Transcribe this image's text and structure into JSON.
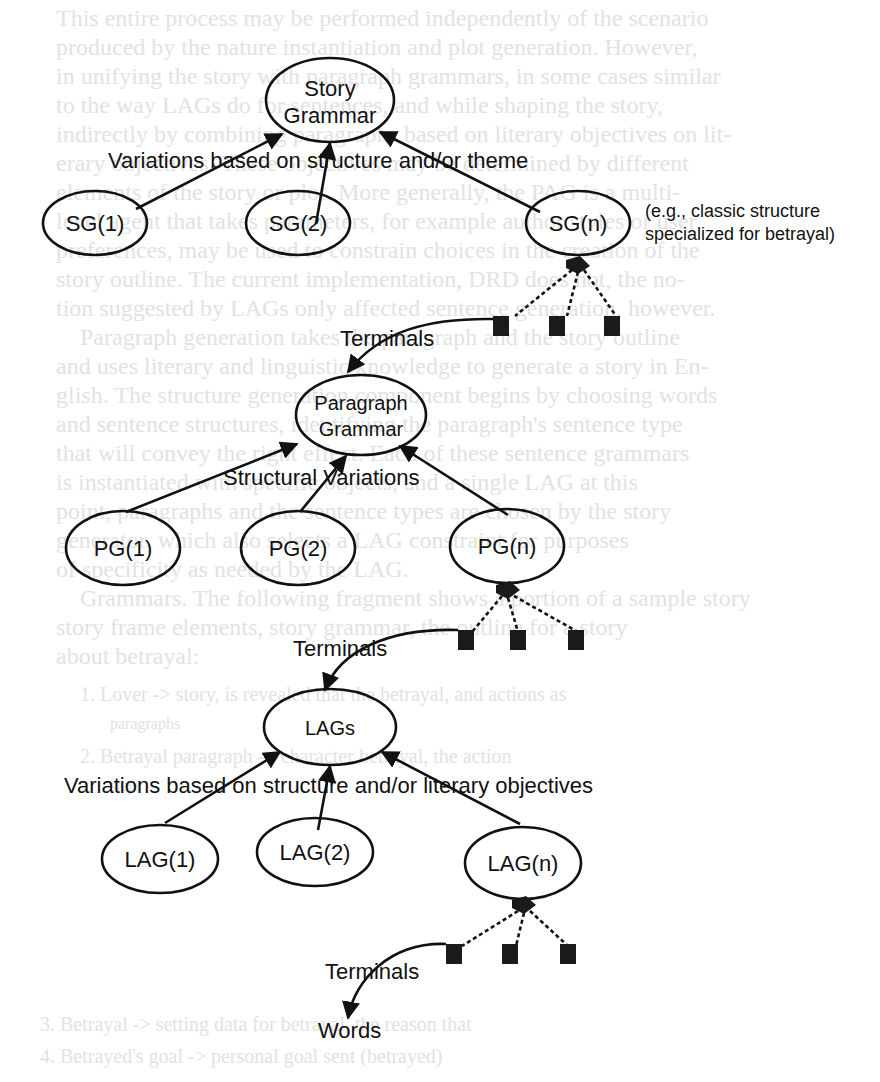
{
  "background_text": {
    "lines": [
      "This entire process may be performed independently of the scenario",
      "produced by the nature instantiation and plot generation. However,",
      "in unifying the story with paragraph grammars, in some cases similar",
      "to the way LAGs do for sentences, and while shaping the story,",
      "indirectly by combining paragraphs based on literary objectives on lit-",
      "erary objectives. These objectives may be determined by different",
      "elements of the story or plot. More generally, the PAG is a multi-",
      "level agent that takes parameters, for example author styles or user",
      "preferences, may be used to constrain choices in the creation of the",
      "story outline. The current implementation, DRD does not, the no-",
      "tion suggested by LAGs only affected sentence generation, however.",
      "Paragraph generation takes the paragraph and the story outline",
      "and uses literary and linguistic knowledge to generate a story in En-",
      "glish. The structure generation component begins by choosing words",
      "and sentence structures, identifying the paragraph's sentence type",
      "that will convey the right effect. Each of these sentence grammars",
      "is instantiated with specific objects, and a single LAG at this",
      "point, paragraphs and the sentence types are chosen by the story",
      "generator, which also selects a LAG constraint for purposes",
      "of specificity as needed by the LAG.",
      "Grammars. The following fragment shows a portion of a sample story",
      "story frame elements, story grammar, the outline for a story",
      "about betrayal:",
      "1. Lover -> story, is revealed that the betrayal, and actions as",
      "     paragraphs",
      "2. Betrayal paragraph -> character betrayal, the action",
      "     steps",
      "3. Betrayal -> setting data for betrayal, the reason that",
      "4. Betrayed's goal -> personal goal sent (betrayed)"
    ]
  },
  "diagram": {
    "levels": [
      {
        "id": "story-grammar",
        "root": {
          "label_lines": [
            "Story",
            "Grammar"
          ]
        },
        "variation_label": "Variations based on structure and/or theme",
        "children": [
          {
            "label": "SG(1)"
          },
          {
            "label": "SG(2)"
          },
          {
            "label": "SG(n)"
          }
        ],
        "annotation_lines": [
          "(e.g., classic structure",
          "specialized for betrayal)"
        ],
        "terminals_label": "Terminals"
      },
      {
        "id": "paragraph-grammar",
        "root": {
          "label_lines": [
            "Paragraph",
            "Grammar"
          ]
        },
        "variation_label": "Structural Variations",
        "children": [
          {
            "label": "PG(1)"
          },
          {
            "label": "PG(2)"
          },
          {
            "label": "PG(n)"
          }
        ],
        "terminals_label": "Terminals"
      },
      {
        "id": "lags",
        "root": {
          "label_lines": [
            "LAGs"
          ]
        },
        "variation_label": "Variations based on structure and/or literary objectives",
        "children": [
          {
            "label": "LAG(1)"
          },
          {
            "label": "LAG(2)"
          },
          {
            "label": "LAG(n)"
          }
        ],
        "terminals_label": "Terminals"
      }
    ],
    "output_label": "Words",
    "colors": {
      "ink": "#111111",
      "bleed_text": "#e2e2e2",
      "background": "#ffffff"
    }
  }
}
